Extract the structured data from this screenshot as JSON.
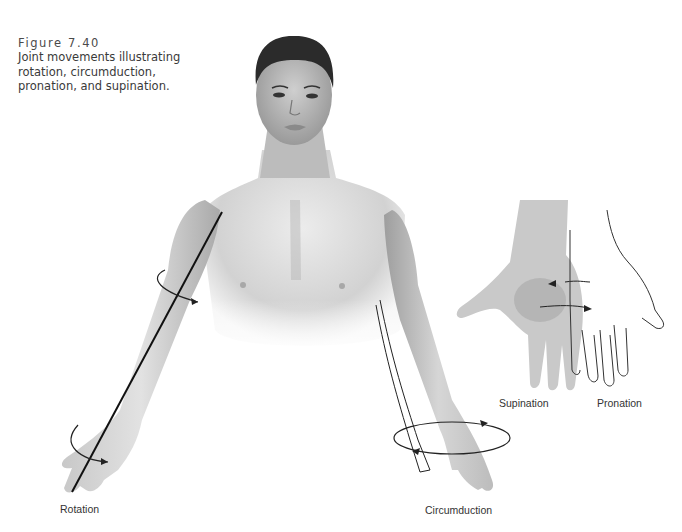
{
  "figure": {
    "number": "Figure 7.40",
    "caption_lines": [
      "Joint movements illustrating",
      "rotation, circumduction,",
      "pronation, and supination."
    ]
  },
  "labels": {
    "rotation": "Rotation",
    "circumduction": "Circumduction",
    "supination": "Supination",
    "pronation": "Pronation"
  },
  "illustration": {
    "subject": "human-torso-with-arms",
    "movements": [
      "rotation",
      "circumduction",
      "supination",
      "pronation"
    ],
    "colors": {
      "skin_light": "#e6e6e6",
      "skin_mid": "#bdbdbd",
      "skin_dark": "#8a8a8a",
      "hair": "#2b2b2b",
      "line": "#1a1a1a"
    }
  }
}
